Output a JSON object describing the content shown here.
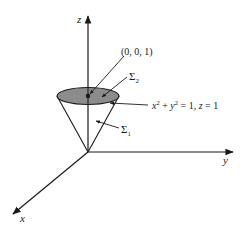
{
  "diagram": {
    "type": "3d-surface-sketch",
    "axes": {
      "z_label": "z",
      "y_label": "y",
      "x_label": "x"
    },
    "point_label": "(0, 0, 1)",
    "surface_top_label": "Σ",
    "surface_top_sub": "2",
    "surface_side_label": "Σ",
    "surface_side_sub": "1",
    "boundary_label": {
      "x": "x",
      "x_exp": "2",
      "plus": " + ",
      "y": "y",
      "y_exp": "2",
      "rest": " = 1, ",
      "z": "z",
      "z_rest": " = 1"
    },
    "colors": {
      "line": "#1a1a1a",
      "disk_fill": "#8c8c8c",
      "background": "#ffffff"
    }
  }
}
